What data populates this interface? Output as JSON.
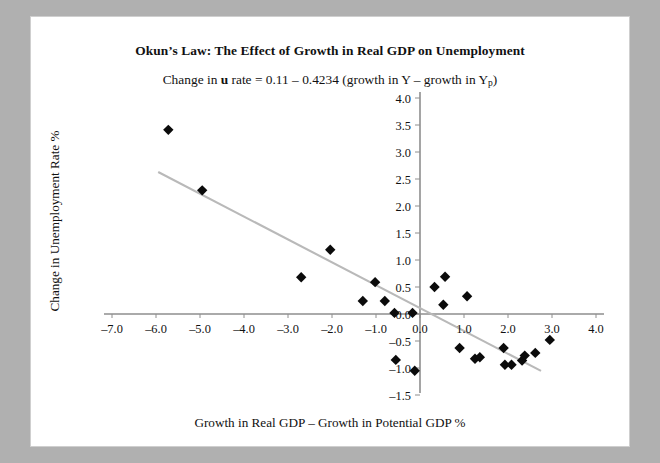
{
  "card": {
    "title": "Okun’s Law: The Effect of Growth in Real GDP on Unemployment",
    "subtitle_parts": {
      "a": "Change in ",
      "b": "u",
      "c": " rate = 0.11 – 0.4234 (growth in Y – growth in Y",
      "d": "p",
      "e": ")"
    },
    "subtitle_plain": "Change in u rate = 0.11 – 0.4234 (growth in Y – growth in Yp)"
  },
  "colors": {
    "background": "#b0b0b0",
    "card": "#ffffff",
    "axis": "#8e8e8e",
    "trendline": "#b9b9b9",
    "marker": "#0b0b0b",
    "text": "#111111"
  },
  "chart_data": {
    "type": "scatter",
    "title": "Okun’s Law: The Effect of Growth in Real GDP on Unemployment",
    "subtitle": "Change in u rate = 0.11 – 0.4234 (growth in Y – growth in Yp)",
    "xlabel": "Growth in Real GDP – Growth in Potential GDP %",
    "ylabel": "Change in Unemployment Rate %",
    "xlim": [
      -7.0,
      4.0
    ],
    "ylim": [
      -1.5,
      4.0
    ],
    "xticks": [
      "-7.0",
      "-6.0",
      "-5.0",
      "-4.0",
      "-3.0",
      "-2.0",
      "-1.0",
      "0.0",
      "1.0",
      "2.0",
      "3.0",
      "4.0"
    ],
    "xtick_values": [
      -7,
      -6,
      -5,
      -4,
      -3,
      -2,
      -1,
      0,
      1,
      2,
      3,
      4
    ],
    "yticks": [
      "4.0",
      "3.5",
      "3.0",
      "2.5",
      "2.0",
      "1.5",
      "1.0",
      "0.5",
      "0.0",
      "-0.5",
      "-1.0",
      "-1.5"
    ],
    "ytick_values": [
      4.0,
      3.5,
      3.0,
      2.5,
      2.0,
      1.5,
      1.0,
      0.5,
      0.0,
      -0.5,
      -1.0,
      -1.5
    ],
    "grid": false,
    "legend": "none",
    "axes_cross_at": [
      0,
      0
    ],
    "points": [
      {
        "x": -5.72,
        "y": 3.41
      },
      {
        "x": -4.95,
        "y": 2.29
      },
      {
        "x": -2.04,
        "y": 1.19
      },
      {
        "x": -2.7,
        "y": 0.68
      },
      {
        "x": -1.3,
        "y": 0.24
      },
      {
        "x": -1.02,
        "y": 0.59
      },
      {
        "x": -0.8,
        "y": 0.24
      },
      {
        "x": -0.58,
        "y": 0.02
      },
      {
        "x": -0.17,
        "y": 0.02
      },
      {
        "x": -0.55,
        "y": -0.85
      },
      {
        "x": -0.12,
        "y": -1.05
      },
      {
        "x": 0.33,
        "y": 0.5
      },
      {
        "x": 0.57,
        "y": 0.69
      },
      {
        "x": 0.53,
        "y": 0.17
      },
      {
        "x": 1.07,
        "y": 0.33
      },
      {
        "x": 0.9,
        "y": -0.63
      },
      {
        "x": 1.25,
        "y": -0.83
      },
      {
        "x": 1.36,
        "y": -0.8
      },
      {
        "x": 1.9,
        "y": -0.63
      },
      {
        "x": 1.93,
        "y": -0.94
      },
      {
        "x": 2.08,
        "y": -0.94
      },
      {
        "x": 2.32,
        "y": -0.86
      },
      {
        "x": 2.38,
        "y": -0.77
      },
      {
        "x": 2.62,
        "y": -0.72
      },
      {
        "x": 2.95,
        "y": -0.48
      }
    ],
    "trendline": {
      "intercept": 0.11,
      "slope": -0.4234,
      "x_start": -5.95,
      "x_end": 2.75
    }
  },
  "icons": {
    "marker": "diamond-marker"
  }
}
